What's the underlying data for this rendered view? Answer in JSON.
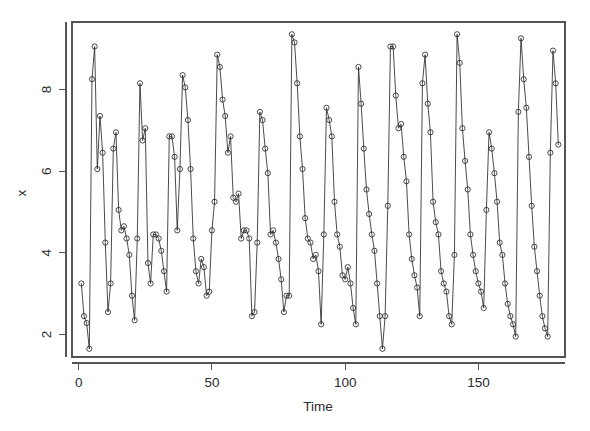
{
  "figure": {
    "width": 590,
    "height": 431,
    "background": "#ffffff",
    "foreground": "#2a2a2a",
    "axis_color": "#555555"
  },
  "plot_area": {
    "left": 72,
    "top": 22,
    "right": 565,
    "bottom": 357
  },
  "axes": {
    "x_title": "Time",
    "y_title": "x",
    "x_ticks": [
      0,
      50,
      100,
      150
    ],
    "x_tick_labels": [
      "0",
      "50",
      "100",
      "150"
    ],
    "y_ticks": [
      2,
      4,
      6,
      8
    ],
    "y_tick_labels": [
      "2",
      "4",
      "6",
      "8"
    ]
  },
  "chart_data": {
    "type": "line",
    "title": "",
    "subtitle": "",
    "xlabel": "Time",
    "ylabel": "x",
    "grid": false,
    "legend": null,
    "marker": "open-circle",
    "line_style": "solid",
    "xlim": [
      -2.5,
      182.5
    ],
    "ylim": [
      1.45,
      9.65
    ],
    "x_tick_values": [
      0,
      50,
      100,
      150
    ],
    "y_tick_values": [
      2,
      4,
      6,
      8
    ],
    "x": [
      1,
      2,
      3,
      4,
      5,
      6,
      7,
      8,
      9,
      10,
      11,
      12,
      13,
      14,
      15,
      16,
      17,
      18,
      19,
      20,
      21,
      22,
      23,
      24,
      25,
      26,
      27,
      28,
      29,
      30,
      31,
      32,
      33,
      34,
      35,
      36,
      37,
      38,
      39,
      40,
      41,
      42,
      43,
      44,
      45,
      46,
      47,
      48,
      49,
      50,
      51,
      52,
      53,
      54,
      55,
      56,
      57,
      58,
      59,
      60,
      61,
      62,
      63,
      64,
      65,
      66,
      67,
      68,
      69,
      70,
      71,
      72,
      73,
      74,
      75,
      76,
      77,
      78,
      79,
      80,
      81,
      82,
      83,
      84,
      85,
      86,
      87,
      88,
      89,
      90,
      91,
      92,
      93,
      94,
      95,
      96,
      97,
      98,
      99,
      100,
      101,
      102,
      103,
      104,
      105,
      106,
      107,
      108,
      109,
      110,
      111,
      112,
      113,
      114,
      115,
      116,
      117,
      118,
      119,
      120,
      121,
      122,
      123,
      124,
      125,
      126,
      127,
      128,
      129,
      130,
      131,
      132,
      133,
      134,
      135,
      136,
      137,
      138,
      139,
      140,
      141,
      142,
      143,
      144,
      145,
      146,
      147,
      148,
      149,
      150,
      151,
      152,
      153,
      154,
      155,
      156,
      157,
      158,
      159,
      160,
      161,
      162,
      163,
      164,
      165,
      166,
      167,
      168,
      169,
      170,
      171,
      172,
      173,
      174,
      175,
      176,
      177,
      178,
      179,
      180
    ],
    "y": [
      3.25,
      2.45,
      2.28,
      1.65,
      8.25,
      9.05,
      6.05,
      7.35,
      6.45,
      4.25,
      2.55,
      3.25,
      6.55,
      6.95,
      5.05,
      4.55,
      4.65,
      4.35,
      3.95,
      2.95,
      2.35,
      4.35,
      8.15,
      6.75,
      7.05,
      3.75,
      3.25,
      4.45,
      4.45,
      4.35,
      4.05,
      3.55,
      3.05,
      6.85,
      6.85,
      6.35,
      4.55,
      6.05,
      8.35,
      8.05,
      7.25,
      6.05,
      4.35,
      3.55,
      3.25,
      3.85,
      3.65,
      2.95,
      3.05,
      4.55,
      5.25,
      8.85,
      8.55,
      7.75,
      7.35,
      6.45,
      6.85,
      5.35,
      5.25,
      5.45,
      4.35,
      4.55,
      4.55,
      4.35,
      2.45,
      2.55,
      4.25,
      7.45,
      7.25,
      6.55,
      5.95,
      4.45,
      4.55,
      4.25,
      3.85,
      3.35,
      2.55,
      2.95,
      2.95,
      9.35,
      9.15,
      8.15,
      6.85,
      6.05,
      4.85,
      4.35,
      4.25,
      3.85,
      3.95,
      3.55,
      2.25,
      4.45,
      7.55,
      7.25,
      6.85,
      5.25,
      4.45,
      4.15,
      3.45,
      3.35,
      3.65,
      3.25,
      2.65,
      2.25,
      8.55,
      7.65,
      6.55,
      5.55,
      4.95,
      4.45,
      4.05,
      3.25,
      2.45,
      1.65,
      2.45,
      5.15,
      9.05,
      9.05,
      7.85,
      7.05,
      7.15,
      6.35,
      5.75,
      4.45,
      3.85,
      3.45,
      3.15,
      2.45,
      8.15,
      8.85,
      7.65,
      6.95,
      5.25,
      4.75,
      4.45,
      3.55,
      3.25,
      3.05,
      2.45,
      2.25,
      3.95,
      9.35,
      8.65,
      7.05,
      6.25,
      5.55,
      4.45,
      3.95,
      3.55,
      3.25,
      3.05,
      2.65,
      5.05,
      6.95,
      6.55,
      5.95,
      5.25,
      4.25,
      3.95,
      3.25,
      2.75,
      2.45,
      2.25,
      1.95,
      7.45,
      9.25,
      8.25,
      7.55,
      6.35,
      5.15,
      4.15,
      3.55,
      2.95,
      2.45,
      2.15,
      1.95,
      6.45,
      8.95,
      8.15,
      6.65,
      6.05,
      5.45,
      4.45,
      3.85,
      3.45,
      2.15
    ]
  }
}
